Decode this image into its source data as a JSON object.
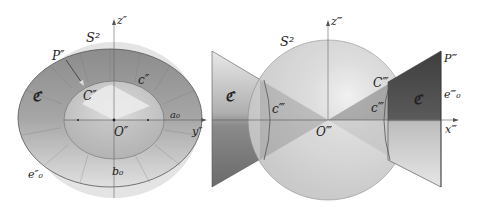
{
  "left_panel": {
    "labels": {
      "sphere": "S²",
      "z_axis": "z″",
      "y_axis": "y″",
      "point_P": "P″",
      "point_C": "C″",
      "origin": "O″",
      "cone_C": "ℭ",
      "curve_c": "c″",
      "a0": "a₀",
      "b0": "b₀",
      "e0": "e″₀"
    }
  },
  "right_panel": {
    "labels": {
      "sphere": "S²",
      "z_axis": "z‴",
      "x_axis": "x‴",
      "point_P": "P‴",
      "point_C": "C‴",
      "origin": "O‴",
      "cone_C_left": "ℭ",
      "cone_C_right": "ℭ",
      "curve_c_left": "c‴",
      "curve_c_right": "c‴",
      "e0": "e‴₀"
    }
  },
  "colors": {
    "sphere_fill": "#d4d4d4",
    "cone_dark": "#4a4a4a",
    "cone_mid": "#8a8a8a",
    "ring_outer": "#9a9a9a",
    "inner_disk": "#c8c8c8"
  }
}
